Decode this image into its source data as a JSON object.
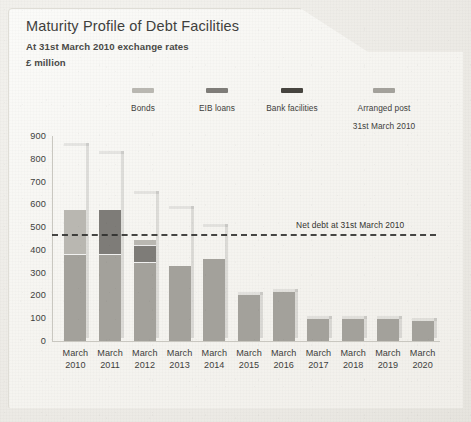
{
  "card": {
    "title": "Maturity Profile of Debt Facilities",
    "subtitle_1": "At 31st March 2010 exchange rates",
    "subtitle_2": "£ million"
  },
  "legend": {
    "items": [
      {
        "label": "Bonds",
        "color": "#b9b7b1"
      },
      {
        "label": "EIB loans",
        "color": "#7e7c78"
      },
      {
        "label": "Bank facilities",
        "color": "#46443f"
      },
      {
        "label": "Arranged post\n31st March 2010",
        "color": "#a3a19b"
      }
    ]
  },
  "chart_data": {
    "type": "bar",
    "subtype": "stacked-bar",
    "title": "Maturity Profile of Debt Facilities",
    "subtitle": "At 31st March 2010 exchange rates",
    "xlabel": "",
    "ylabel": "£ million",
    "ylim": [
      0,
      900
    ],
    "yticks": [
      0,
      100,
      200,
      300,
      400,
      500,
      600,
      700,
      800,
      900
    ],
    "grid": false,
    "legend_position": "top",
    "categories": [
      "March\n2010",
      "March\n2011",
      "March\n2012",
      "March\n2013",
      "March\n2014",
      "March\n2015",
      "March\n2016",
      "March\n2017",
      "March\n2018",
      "March\n2019",
      "March\n2020"
    ],
    "series": [
      {
        "name": "Arranged post 31st March 2010",
        "color": "#a3a19b",
        "values": [
          380,
          380,
          345,
          330,
          360,
          200,
          215,
          95,
          95,
          95,
          90
        ]
      },
      {
        "name": "Bank facilities",
        "color": "#46443f",
        "values": [
          0,
          0,
          0,
          0,
          0,
          0,
          0,
          0,
          0,
          0,
          0
        ]
      },
      {
        "name": "EIB loans",
        "color": "#7e7c78",
        "values": [
          0,
          195,
          75,
          0,
          0,
          0,
          0,
          0,
          0,
          0,
          0
        ]
      },
      {
        "name": "Bonds",
        "color": "#b9b7b1",
        "values": [
          195,
          0,
          25,
          0,
          0,
          0,
          0,
          0,
          0,
          0,
          0
        ]
      }
    ],
    "stack_totals": [
      855,
      820,
      645,
      580,
      500,
      200,
      215,
      95,
      95,
      95,
      90
    ],
    "annotations": [
      {
        "type": "hline",
        "label": "Net debt at 31st March 2010",
        "value": 470,
        "style": "dashed",
        "color": "#2e2e2c"
      }
    ]
  }
}
